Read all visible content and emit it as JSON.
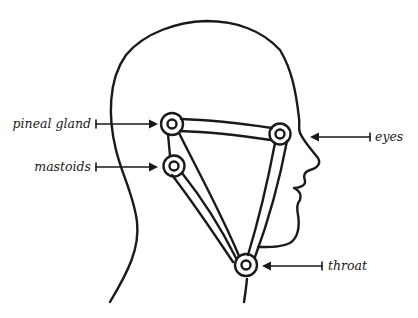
{
  "diagram": {
    "type": "anatomical-head-profile",
    "labels": {
      "pineal": "pineal gland",
      "mastoids": "mastoids",
      "eyes": "eyes",
      "throat": "throat"
    },
    "nodes": [
      {
        "id": "pineal",
        "x": 172,
        "y": 124
      },
      {
        "id": "mastoids",
        "x": 174,
        "y": 166
      },
      {
        "id": "eyes",
        "x": 280,
        "y": 134
      },
      {
        "id": "throat",
        "x": 246,
        "y": 265
      }
    ],
    "colors": {
      "ink": "#1a1a1a",
      "background": "#ffffff"
    }
  }
}
